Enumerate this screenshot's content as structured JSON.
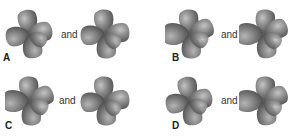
{
  "question": {
    "connector_text": "and",
    "colors": {
      "lobe_base": "#7d7d7d",
      "lobe_highlight": "#c4c4c4",
      "lobe_shadow": "#4e4e4e",
      "text": "#222222"
    },
    "options": [
      {
        "label": "A",
        "left": {
          "description": "four-lobe d-orbital, lobes between axes, slight 3D tilt",
          "rotation": 0
        },
        "right": {
          "description": "four-lobe d-orbital, lobes between axes, slight 3D tilt",
          "rotation": 0
        }
      },
      {
        "label": "B",
        "left": {
          "description": "four-lobe d-orbital with one enlarged left-pointing lobe",
          "rotation": 0
        },
        "right": {
          "description": "four-lobe d-orbital with one enlarged left-pointing lobe",
          "rotation": 0
        }
      },
      {
        "label": "C",
        "left": {
          "description": "four-lobe d-orbital with one enlarged left-pointing lobe",
          "rotation": 0
        },
        "right": {
          "description": "four-lobe d-orbital, lobes between axes, slight 3D tilt",
          "rotation": 0
        }
      },
      {
        "label": "D",
        "left": {
          "description": "four-lobe d-orbital, lobes between axes, slight 3D tilt",
          "rotation": 0
        },
        "right": {
          "description": "four-lobe d-orbital with one enlarged left-pointing lobe",
          "rotation": 0
        }
      }
    ]
  }
}
